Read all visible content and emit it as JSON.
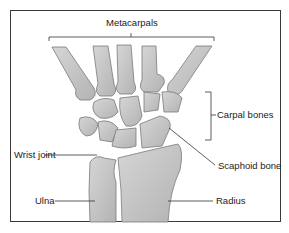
{
  "diagram": {
    "labels": {
      "metacarpals": "Metacarpals",
      "carpal_bones": "Carpal bones",
      "wrist_joint": "Wrist joint",
      "scaphoid_bone": "Scaphoid bone",
      "ulna": "Ulna",
      "radius": "Radius"
    },
    "colors": {
      "bone_fill": "#c4c4c4",
      "bone_stroke": "#7a7a7a",
      "line": "#333333",
      "frame": "#3a3a3a",
      "background": "#ffffff"
    }
  }
}
